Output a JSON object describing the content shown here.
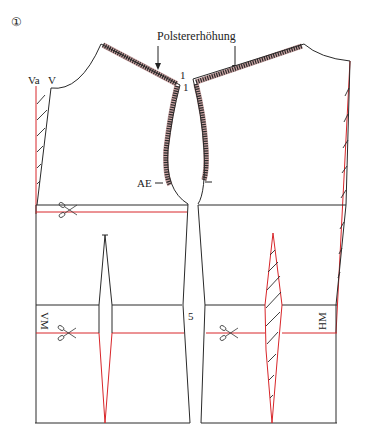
{
  "figure": {
    "number": "①",
    "annotation": "Polstererhöhung",
    "colors": {
      "outline": "#2a2a2a",
      "correction": "#d8262a"
    }
  },
  "labels": {
    "va": "Va",
    "v": "V",
    "point_1_left": "1",
    "point_1_right": "1",
    "ae": "AE",
    "vm": "VM",
    "hm": "HM",
    "five": "5"
  },
  "icons": {
    "scissors_top": "scissors-icon",
    "scissors_front_waist": "scissors-icon",
    "scissors_back_waist": "scissors-icon"
  }
}
